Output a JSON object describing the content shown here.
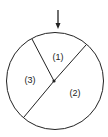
{
  "diagram": {
    "type": "spinner",
    "regions": [
      {
        "label": "(1)"
      },
      {
        "label": "(2)"
      },
      {
        "label": "(3)"
      }
    ],
    "pointer": "down-arrow"
  }
}
